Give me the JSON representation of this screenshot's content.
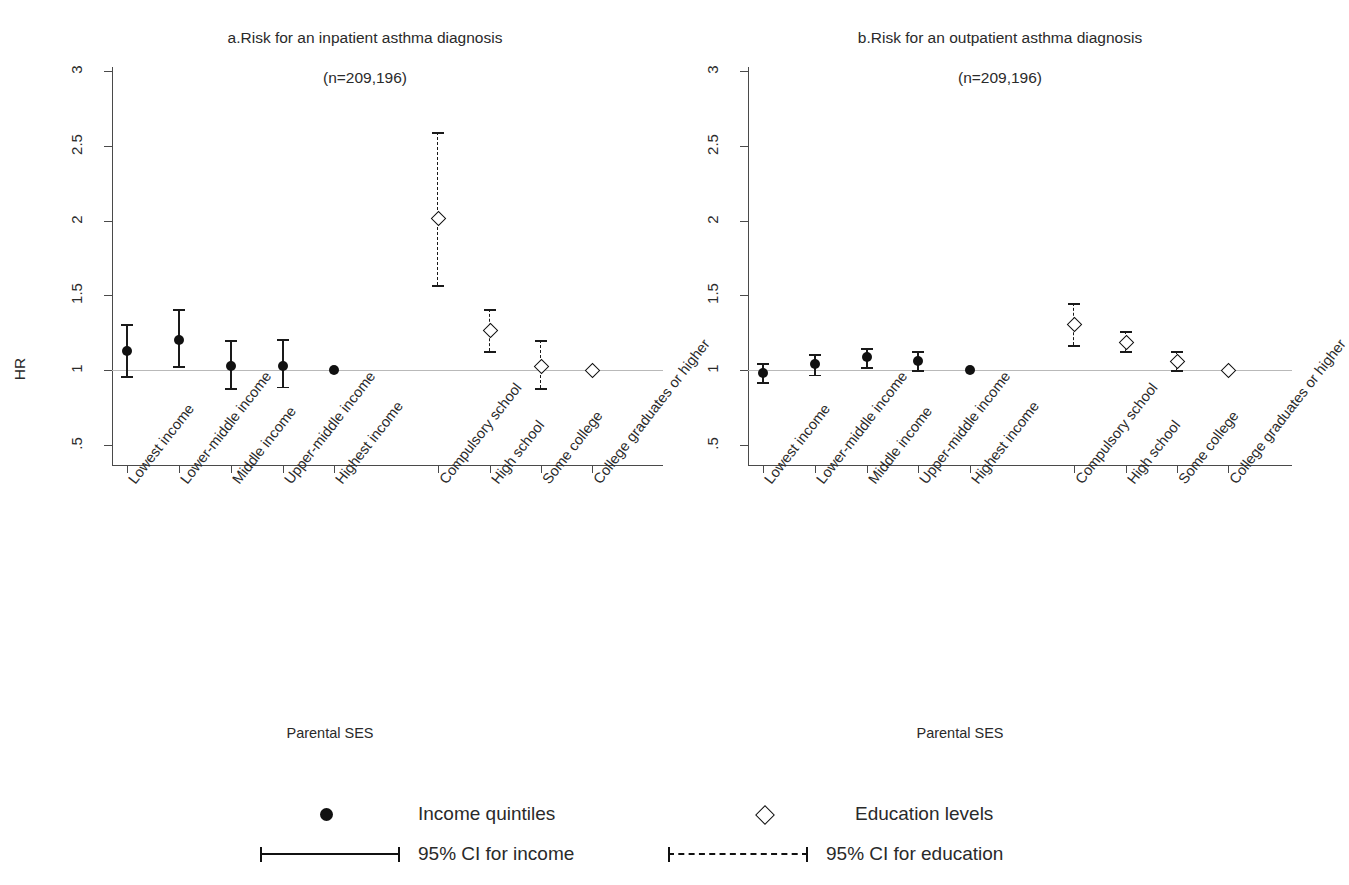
{
  "figure": {
    "ylabel": "HR",
    "xlabel": "Parental SES"
  },
  "panels": [
    {
      "id": "a",
      "title": "a.Risk for an inpatient asthma diagnosis",
      "subtitle": "(n=209,196)"
    },
    {
      "id": "b",
      "title": "b.Risk for an outpatient asthma diagnosis",
      "subtitle": "(n=209,196)"
    }
  ],
  "legend": {
    "income_marker_label": "Income quintiles",
    "income_ci_label": "95% CI for income",
    "education_marker_label": "Education levels",
    "education_ci_label": "95% CI for education",
    "income_marker_icon": "filled-circle-icon",
    "education_marker_icon": "open-diamond-icon",
    "income_ci_icon": "solid-errorbar-icon",
    "education_ci_icon": "dashed-errorbar-icon"
  },
  "axis": {
    "y_ticks": [
      ".5",
      "1",
      "1.5",
      "2",
      "2.5",
      "3"
    ],
    "y_tick_values": [
      0.5,
      1.0,
      1.5,
      2.0,
      2.5,
      3.0
    ],
    "ylim": [
      0.45,
      3.1
    ],
    "reference_value": 1.0
  },
  "chart_data": {
    "type": "scatter",
    "xlabel": "Parental SES",
    "ylabel": "HR",
    "ylim": [
      0.45,
      3.1
    ],
    "y_ticks": [
      0.5,
      1.0,
      1.5,
      2.0,
      2.5,
      3.0
    ],
    "grid": false,
    "reference_line": 1.0,
    "legend_position": "bottom",
    "categories": [
      "Lowest income",
      "Lower-middle income",
      "Middle income",
      "Upper-middle income",
      "Highest income",
      "Compulsory school",
      "High school",
      "Some college",
      "College graduates or higher"
    ],
    "panels": [
      {
        "id": "a",
        "title": "a.Risk for an inpatient asthma diagnosis",
        "subtitle": "(n=209,196)",
        "n": "209,196",
        "series": [
          {
            "name": "Income quintiles",
            "marker": "filled-circle",
            "ci_style": "solid",
            "points": [
              {
                "label": "Lowest income",
                "hr": 1.13,
                "lo": 0.96,
                "hi": 1.31
              },
              {
                "label": "Lower-middle income",
                "hr": 1.2,
                "lo": 1.03,
                "hi": 1.41
              },
              {
                "label": "Middle income",
                "hr": 1.03,
                "lo": 0.88,
                "hi": 1.2
              },
              {
                "label": "Upper-middle income",
                "hr": 1.03,
                "lo": 0.89,
                "hi": 1.21
              },
              {
                "label": "Highest income",
                "hr": 1.0,
                "lo": 1.0,
                "hi": 1.0
              }
            ]
          },
          {
            "name": "Education levels",
            "marker": "open-diamond",
            "ci_style": "dashed",
            "points": [
              {
                "label": "Compulsory school",
                "hr": 2.02,
                "lo": 1.57,
                "hi": 2.59
              },
              {
                "label": "High school",
                "hr": 1.27,
                "lo": 1.13,
                "hi": 1.41
              },
              {
                "label": "Some college",
                "hr": 1.03,
                "lo": 0.88,
                "hi": 1.2
              },
              {
                "label": "College graduates or higher",
                "hr": 1.0,
                "lo": 1.0,
                "hi": 1.0
              }
            ]
          }
        ]
      },
      {
        "id": "b",
        "title": "b.Risk for an outpatient asthma diagnosis",
        "subtitle": "(n=209,196)",
        "n": "209,196",
        "series": [
          {
            "name": "Income quintiles",
            "marker": "filled-circle",
            "ci_style": "solid",
            "points": [
              {
                "label": "Lowest income",
                "hr": 0.98,
                "lo": 0.92,
                "hi": 1.05
              },
              {
                "label": "Lower-middle income",
                "hr": 1.04,
                "lo": 0.97,
                "hi": 1.11
              },
              {
                "label": "Middle income",
                "hr": 1.09,
                "lo": 1.02,
                "hi": 1.15
              },
              {
                "label": "Upper-middle income",
                "hr": 1.06,
                "lo": 1.0,
                "hi": 1.13
              },
              {
                "label": "Highest income",
                "hr": 1.0,
                "lo": 1.0,
                "hi": 1.0
              }
            ]
          },
          {
            "name": "Education levels",
            "marker": "open-diamond",
            "ci_style": "dashed",
            "points": [
              {
                "label": "Compulsory school",
                "hr": 1.31,
                "lo": 1.17,
                "hi": 1.45
              },
              {
                "label": "High school",
                "hr": 1.19,
                "lo": 1.13,
                "hi": 1.26
              },
              {
                "label": "Some college",
                "hr": 1.06,
                "lo": 1.0,
                "hi": 1.13
              },
              {
                "label": "College graduates or higher",
                "hr": 1.0,
                "lo": 1.0,
                "hi": 1.0
              }
            ]
          }
        ]
      }
    ]
  }
}
